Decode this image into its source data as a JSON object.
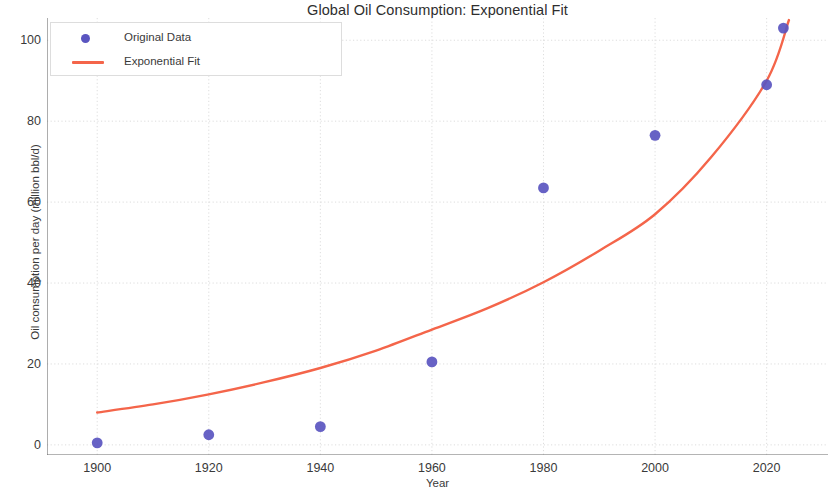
{
  "chart_data": {
    "type": "scatter",
    "title": "Global Oil Consumption: Exponential Fit",
    "xlabel": "Year",
    "ylabel": "Oil consumption per day (million bbl/d)",
    "xlim": [
      1891,
      2031
    ],
    "ylim": [
      -2.5,
      105.5
    ],
    "grid": true,
    "legend_position": "upper left",
    "xticks": [
      1900,
      1920,
      1940,
      1960,
      1980,
      2000,
      2020
    ],
    "xtick_labels": [
      "1900",
      "1920",
      "1940",
      "1960",
      "1980",
      "2000",
      "2020"
    ],
    "yticks": [
      0,
      20,
      40,
      60,
      80,
      100
    ],
    "ytick_labels": [
      "0",
      "20",
      "40",
      "60",
      "80",
      "100"
    ],
    "series": [
      {
        "name": "Original Data",
        "type": "scatter",
        "color": "#5a55c0",
        "marker": "circle",
        "x": [
          1900,
          1920,
          1940,
          1960,
          1980,
          2000,
          2020,
          2023
        ],
        "values": [
          0.5,
          2.5,
          4.5,
          20.5,
          63.5,
          76.5,
          89.0,
          103.0
        ]
      },
      {
        "name": "Exponential Fit",
        "type": "line",
        "color": "#f4654a",
        "x": [
          1900,
          1910,
          1920,
          1930,
          1940,
          1950,
          1960,
          1970,
          1980,
          1990,
          2000,
          2010,
          2020,
          2024
        ],
        "values": [
          8.0,
          10.0,
          12.5,
          15.5,
          19.0,
          23.3,
          28.5,
          33.8,
          40.2,
          48.0,
          57.0,
          71.0,
          90.0,
          105.0
        ]
      }
    ]
  },
  "legend": {
    "entries": [
      {
        "label": "Original Data",
        "symbol": "dot-marker"
      },
      {
        "label": "Exponential Fit",
        "symbol": "line-marker"
      }
    ]
  },
  "colors": {
    "data_points": "#5a55c0",
    "fit_line": "#f4654a",
    "grid": "#d9d9d9",
    "axis": "#555555",
    "background": "#ffffff"
  }
}
